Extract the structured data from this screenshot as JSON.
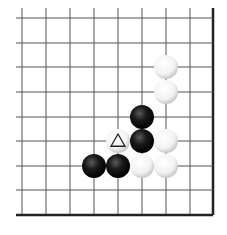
{
  "diagram": {
    "type": "go-board-fragment",
    "grid": {
      "x_lines": [
        22,
        46,
        70,
        94,
        118,
        142,
        166,
        190,
        213
      ],
      "y_lines": [
        18,
        43,
        67,
        92,
        117,
        141,
        166,
        190,
        215
      ],
      "x_start": 16,
      "y_start": 8,
      "right_edge": 213,
      "bottom_edge": 215,
      "line_color": "#555555",
      "edge_color": "#222222"
    },
    "stone_radius": 12,
    "stones": [
      {
        "color": "white",
        "col": 6,
        "row": 2
      },
      {
        "color": "white",
        "col": 6,
        "row": 3
      },
      {
        "color": "black",
        "col": 5,
        "row": 4
      },
      {
        "color": "white",
        "col": 4,
        "row": 5,
        "mark": "triangle"
      },
      {
        "color": "black",
        "col": 5,
        "row": 5
      },
      {
        "color": "white",
        "col": 6,
        "row": 5
      },
      {
        "color": "black",
        "col": 3,
        "row": 6
      },
      {
        "color": "black",
        "col": 4,
        "row": 6
      },
      {
        "color": "white",
        "col": 5,
        "row": 6
      },
      {
        "color": "white",
        "col": 6,
        "row": 6
      }
    ]
  }
}
